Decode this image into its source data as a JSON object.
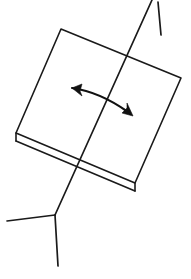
{
  "figure": {
    "type": "line-drawing",
    "background_color": "#ffffff",
    "stroke_color": "#1a1a1a",
    "arrow_color": "#111111",
    "canvas": {
      "width": 191,
      "height": 279
    },
    "stroke_width": 1.6,
    "arrow_stroke_width": 2.2
  },
  "parts": {
    "tray": {
      "name": "music-stand-tray",
      "description": "tilted rectangular desk panel",
      "corners": {
        "top_left": [
          61,
          29
        ],
        "top_right": [
          181,
          78
        ],
        "bottom_right": [
          135,
          183
        ],
        "bottom_left": [
          16,
          133
        ]
      },
      "path": "M 61 29 L 181 78 L 135 183 L 16 133 Z"
    },
    "lip": {
      "name": "music-stand-lip",
      "description": "ledge rail along the lower edge of the tray",
      "path": "M 16 141 L 135 191"
    },
    "lip_ends": {
      "name": "music-stand-lip-ends",
      "left": "M 16 133 L 16 141",
      "right": "M 135 183 L 135 191"
    },
    "pole": {
      "name": "music-stand-pole",
      "description": "central support column passing across the tray",
      "path": "M 152 0 L 55 215"
    },
    "pole_extension": {
      "name": "music-stand-pole-extension",
      "description": "short telescoping rod beside the top of the pole",
      "path": "M 158 2 L 161 35"
    },
    "leg_left": {
      "name": "music-stand-leg-left",
      "path": "M 55 215 L 7 221"
    },
    "leg_front": {
      "name": "music-stand-leg-front",
      "path": "M 55 215 L 58 266"
    },
    "tilt_arrow": {
      "name": "tilt-adjust-arrow",
      "description": "double-headed curved arrow showing tilt direction",
      "curve": "M 72 88 Q 100 92 128 112",
      "head_left": "M 72 88 L 82 84 L 80 91 L 82 96 Z",
      "head_right": "M 133 116 L 122 113 L 127 108 L 127 103 Z"
    }
  },
  "labels": {
    "figure_caption": "Music stand with tilt adjustment arrow",
    "arrow_meaning": "tilt / rotate desk"
  }
}
